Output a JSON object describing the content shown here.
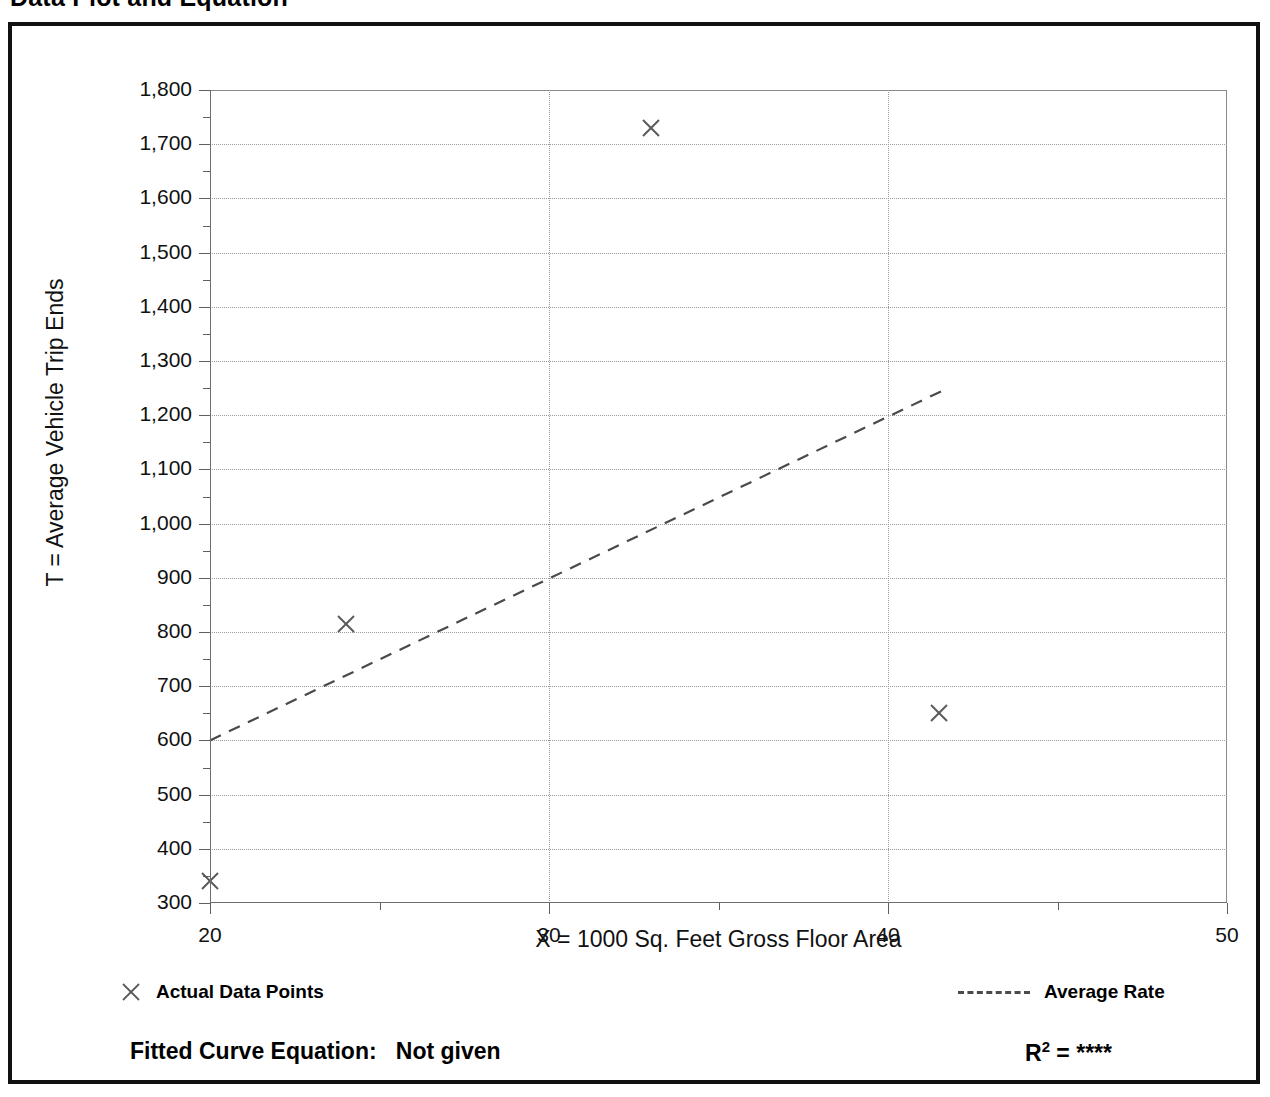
{
  "document": {
    "title": "Data Plot and Equation"
  },
  "axis_titles": {
    "y": "T = Average Vehicle Trip Ends",
    "x": "X = 1000 Sq. Feet Gross Floor Area"
  },
  "legend": {
    "data_points_label": "Actual Data Points",
    "data_points_marker": "x-marker-icon",
    "average_rate_label": "Average Rate",
    "average_rate_marker": "dashed-line-icon"
  },
  "footer": {
    "fitted_curve_label": "Fitted Curve Equation:",
    "fitted_curve_value": "Not given",
    "r_squared_label": "R",
    "r_squared_exponent": "2",
    "r_squared_equals": "=",
    "r_squared_value": "****"
  },
  "chart_data": {
    "type": "scatter",
    "title": "Data Plot and Equation",
    "xlabel": "X = 1000 Sq. Feet Gross Floor Area",
    "ylabel": "T = Average Vehicle Trip Ends",
    "xlim": [
      20,
      50
    ],
    "ylim": [
      300,
      1800
    ],
    "grid": true,
    "legend_position": "below-plot",
    "x_ticks_major": [
      20,
      30,
      40,
      50
    ],
    "x_tick_labels": [
      "20",
      "30",
      "40",
      "50"
    ],
    "x_ticks_minor": [
      25,
      35,
      45
    ],
    "y_ticks_major": [
      300,
      400,
      500,
      600,
      700,
      800,
      900,
      1000,
      1100,
      1200,
      1300,
      1400,
      1500,
      1600,
      1700,
      1800
    ],
    "y_tick_labels": [
      "300",
      "400",
      "500",
      "600",
      "700",
      "800",
      "900",
      "1,000",
      "1,100",
      "1,200",
      "1,300",
      "1,400",
      "1,500",
      "1,600",
      "1,700",
      "1,800"
    ],
    "y_ticks_minor": [
      350,
      450,
      550,
      650,
      750,
      850,
      950,
      1050,
      1150,
      1250,
      1350,
      1450,
      1550,
      1650,
      1750
    ],
    "series": [
      {
        "name": "Actual Data Points",
        "type": "scatter",
        "marker": "x",
        "points": [
          {
            "x": 20.0,
            "y": 341
          },
          {
            "x": 24.0,
            "y": 815
          },
          {
            "x": 33.0,
            "y": 1730
          },
          {
            "x": 41.5,
            "y": 650
          }
        ]
      },
      {
        "name": "Average Rate",
        "type": "line",
        "style": "dashed",
        "points": [
          {
            "x": 20.0,
            "y": 600
          },
          {
            "x": 41.7,
            "y": 1248
          }
        ]
      }
    ]
  }
}
